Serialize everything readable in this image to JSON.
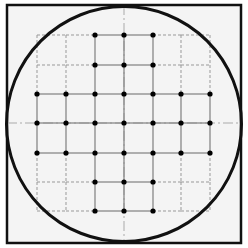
{
  "diagram": {
    "title": "",
    "colors": {
      "page_background": "#ffffff",
      "box_fill": "#f4f4f4",
      "box_stroke": "#111111",
      "circle_stroke": "#111111",
      "solid_grid": "#888888",
      "dashed_grid": "#999999",
      "centerline": "#aaaaaa",
      "dot": "#000000"
    },
    "box": {
      "x": 7,
      "y": 5,
      "width": 234,
      "height": 238,
      "stroke_width": 2.5
    },
    "circle": {
      "cx": 124,
      "cy": 124,
      "r": 117.5,
      "stroke_width": 3
    },
    "grid": {
      "x": [
        37,
        66,
        95,
        124,
        153,
        181,
        210
      ],
      "y": [
        35,
        65,
        94,
        123,
        153,
        182,
        211
      ],
      "dot_radius": 2.6,
      "dots": [
        [
          0,
          2
        ],
        [
          0,
          3
        ],
        [
          0,
          4
        ],
        [
          1,
          2
        ],
        [
          1,
          3
        ],
        [
          1,
          4
        ],
        [
          2,
          0
        ],
        [
          2,
          1
        ],
        [
          2,
          2
        ],
        [
          2,
          3
        ],
        [
          2,
          4
        ],
        [
          2,
          5
        ],
        [
          2,
          6
        ],
        [
          3,
          0
        ],
        [
          3,
          1
        ],
        [
          3,
          2
        ],
        [
          3,
          3
        ],
        [
          3,
          4
        ],
        [
          3,
          5
        ],
        [
          3,
          6
        ],
        [
          4,
          0
        ],
        [
          4,
          1
        ],
        [
          4,
          2
        ],
        [
          4,
          3
        ],
        [
          4,
          4
        ],
        [
          4,
          5
        ],
        [
          4,
          6
        ],
        [
          5,
          2
        ],
        [
          5,
          3
        ],
        [
          5,
          4
        ],
        [
          6,
          2
        ],
        [
          6,
          3
        ],
        [
          6,
          4
        ]
      ],
      "description": "7x7 grid of die/site positions inside a circular wafer outline; 33 populated sites (dots) connected by solid lines, unpopulated corner regions outlined with dashed lines"
    },
    "centerlines": {
      "vertical": {
        "x": 124,
        "y1": 5,
        "y2": 243
      },
      "horizontal": {
        "y": 123,
        "x1": 7,
        "x2": 241
      }
    }
  }
}
